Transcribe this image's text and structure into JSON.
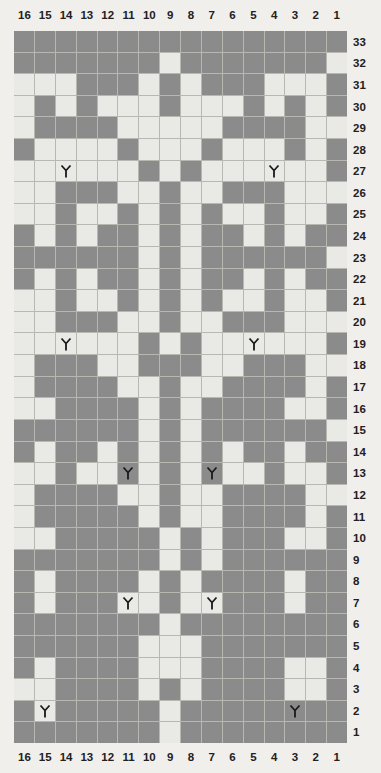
{
  "grid": {
    "columns": 16,
    "rows": 33,
    "column_labels": [
      "16",
      "15",
      "14",
      "13",
      "12",
      "11",
      "10",
      "9",
      "8",
      "7",
      "6",
      "5",
      "4",
      "3",
      "2",
      "1"
    ],
    "row_labels": [
      "33",
      "32",
      "31",
      "30",
      "29",
      "28",
      "27",
      "26",
      "25",
      "24",
      "23",
      "22",
      "21",
      "20",
      "19",
      "18",
      "17",
      "16",
      "15",
      "14",
      "13",
      "12",
      "11",
      "10",
      "9",
      "8",
      "7",
      "6",
      "5",
      "4",
      "3",
      "2",
      "1"
    ],
    "colors": {
      "background": "#f0efec",
      "light_cell": "#e9e9e5",
      "dark_cell": "#8b8b8b",
      "gridline": "#b9b7b2",
      "label_text": "#23201e",
      "symbol": "#1a1a1a"
    },
    "legend": {
      "light_cell_meaning": "knit / main color stitch",
      "dark_cell_meaning": "purl / contrast color stitch",
      "symbol_name": "decrease-symbol",
      "symbol_glyph": "Y"
    }
  },
  "chart_data": {
    "type": "heatmap",
    "xlabel": "",
    "ylabel": "",
    "x": [
      "16",
      "15",
      "14",
      "13",
      "12",
      "11",
      "10",
      "9",
      "8",
      "7",
      "6",
      "5",
      "4",
      "3",
      "2",
      "1"
    ],
    "y": [
      "33",
      "32",
      "31",
      "30",
      "29",
      "28",
      "27",
      "26",
      "25",
      "24",
      "23",
      "22",
      "21",
      "20",
      "19",
      "18",
      "17",
      "16",
      "15",
      "14",
      "13",
      "12",
      "11",
      "10",
      "9",
      "8",
      "7",
      "6",
      "5",
      "4",
      "3",
      "2",
      "1"
    ],
    "value_legend": {
      "0": "light",
      "1": "dark"
    },
    "rows": [
      {
        "row": "33",
        "cells": [
          1,
          1,
          1,
          1,
          1,
          1,
          1,
          1,
          1,
          1,
          1,
          1,
          1,
          1,
          1,
          1
        ]
      },
      {
        "row": "32",
        "cells": [
          1,
          1,
          1,
          1,
          1,
          1,
          1,
          0,
          1,
          1,
          1,
          1,
          1,
          1,
          1,
          0
        ]
      },
      {
        "row": "31",
        "cells": [
          0,
          0,
          0,
          1,
          1,
          1,
          0,
          1,
          0,
          1,
          1,
          1,
          0,
          0,
          0,
          1
        ]
      },
      {
        "row": "30",
        "cells": [
          0,
          1,
          0,
          1,
          0,
          0,
          0,
          1,
          0,
          0,
          0,
          1,
          0,
          1,
          0,
          1
        ]
      },
      {
        "row": "29",
        "cells": [
          0,
          1,
          1,
          1,
          1,
          0,
          0,
          0,
          0,
          0,
          1,
          1,
          1,
          1,
          0,
          0
        ]
      },
      {
        "row": "28",
        "cells": [
          1,
          0,
          0,
          0,
          0,
          1,
          0,
          0,
          0,
          1,
          0,
          0,
          0,
          1,
          0,
          1
        ]
      },
      {
        "row": "27",
        "cells": [
          0,
          0,
          0,
          0,
          0,
          0,
          1,
          0,
          1,
          0,
          0,
          0,
          0,
          0,
          0,
          1
        ]
      },
      {
        "row": "26",
        "cells": [
          0,
          0,
          1,
          1,
          1,
          0,
          0,
          1,
          0,
          0,
          1,
          1,
          1,
          0,
          0,
          0
        ]
      },
      {
        "row": "25",
        "cells": [
          0,
          0,
          1,
          0,
          0,
          1,
          0,
          1,
          0,
          1,
          0,
          0,
          1,
          0,
          0,
          1
        ]
      },
      {
        "row": "24",
        "cells": [
          1,
          0,
          1,
          0,
          1,
          1,
          0,
          1,
          0,
          1,
          1,
          0,
          1,
          0,
          1,
          1
        ]
      },
      {
        "row": "23",
        "cells": [
          1,
          1,
          1,
          1,
          1,
          1,
          0,
          1,
          0,
          1,
          1,
          1,
          1,
          1,
          1,
          0
        ]
      },
      {
        "row": "22",
        "cells": [
          1,
          0,
          1,
          0,
          1,
          1,
          0,
          1,
          0,
          1,
          1,
          0,
          1,
          0,
          1,
          1
        ]
      },
      {
        "row": "21",
        "cells": [
          0,
          0,
          1,
          0,
          0,
          1,
          0,
          1,
          0,
          1,
          0,
          0,
          1,
          0,
          0,
          1
        ]
      },
      {
        "row": "20",
        "cells": [
          0,
          0,
          1,
          1,
          1,
          0,
          0,
          1,
          0,
          0,
          1,
          1,
          1,
          0,
          0,
          0
        ]
      },
      {
        "row": "19",
        "cells": [
          0,
          0,
          0,
          0,
          0,
          0,
          1,
          0,
          1,
          0,
          0,
          0,
          0,
          0,
          0,
          1
        ]
      },
      {
        "row": "18",
        "cells": [
          0,
          1,
          1,
          1,
          0,
          0,
          1,
          1,
          1,
          0,
          0,
          1,
          1,
          1,
          0,
          0
        ]
      },
      {
        "row": "17",
        "cells": [
          0,
          1,
          1,
          1,
          1,
          0,
          0,
          1,
          0,
          0,
          1,
          1,
          1,
          1,
          0,
          1
        ]
      },
      {
        "row": "16",
        "cells": [
          0,
          0,
          1,
          1,
          1,
          1,
          0,
          1,
          0,
          1,
          1,
          1,
          1,
          0,
          0,
          1
        ]
      },
      {
        "row": "15",
        "cells": [
          1,
          1,
          1,
          1,
          1,
          1,
          0,
          1,
          0,
          1,
          1,
          1,
          1,
          1,
          1,
          0
        ]
      },
      {
        "row": "14",
        "cells": [
          1,
          0,
          1,
          1,
          0,
          1,
          0,
          1,
          0,
          1,
          0,
          1,
          1,
          0,
          1,
          1
        ]
      },
      {
        "row": "13",
        "cells": [
          0,
          0,
          1,
          0,
          0,
          1,
          0,
          1,
          0,
          1,
          0,
          0,
          1,
          0,
          0,
          1
        ]
      },
      {
        "row": "12",
        "cells": [
          0,
          1,
          1,
          1,
          1,
          0,
          0,
          1,
          0,
          0,
          1,
          1,
          1,
          1,
          0,
          0
        ]
      },
      {
        "row": "11",
        "cells": [
          0,
          1,
          1,
          1,
          1,
          1,
          0,
          1,
          0,
          0,
          1,
          1,
          1,
          1,
          0,
          1
        ]
      },
      {
        "row": "10",
        "cells": [
          0,
          0,
          1,
          1,
          1,
          1,
          1,
          0,
          1,
          0,
          1,
          1,
          1,
          0,
          0,
          1
        ]
      },
      {
        "row": "9",
        "cells": [
          1,
          1,
          1,
          1,
          1,
          1,
          1,
          0,
          1,
          0,
          1,
          1,
          1,
          1,
          1,
          1
        ]
      },
      {
        "row": "8",
        "cells": [
          1,
          0,
          1,
          1,
          1,
          1,
          0,
          1,
          0,
          1,
          1,
          1,
          1,
          0,
          1,
          1
        ]
      },
      {
        "row": "7",
        "cells": [
          1,
          0,
          1,
          1,
          1,
          0,
          0,
          1,
          0,
          0,
          1,
          1,
          1,
          0,
          1,
          1
        ]
      },
      {
        "row": "6",
        "cells": [
          1,
          1,
          1,
          1,
          1,
          1,
          1,
          0,
          1,
          1,
          1,
          1,
          1,
          1,
          1,
          1
        ]
      },
      {
        "row": "5",
        "cells": [
          1,
          1,
          1,
          1,
          1,
          1,
          0,
          0,
          0,
          1,
          1,
          1,
          1,
          1,
          1,
          1
        ]
      },
      {
        "row": "4",
        "cells": [
          1,
          0,
          1,
          1,
          1,
          1,
          0,
          0,
          0,
          1,
          1,
          1,
          1,
          0,
          0,
          1
        ]
      },
      {
        "row": "3",
        "cells": [
          0,
          0,
          1,
          1,
          1,
          1,
          0,
          1,
          0,
          1,
          1,
          1,
          1,
          0,
          0,
          1
        ]
      },
      {
        "row": "2",
        "cells": [
          1,
          0,
          1,
          1,
          1,
          1,
          1,
          0,
          1,
          1,
          1,
          1,
          1,
          1,
          1,
          1
        ]
      },
      {
        "row": "1",
        "cells": [
          1,
          1,
          1,
          1,
          1,
          1,
          1,
          0,
          1,
          1,
          1,
          1,
          1,
          1,
          1,
          1
        ]
      }
    ],
    "symbols": [
      {
        "row": "27",
        "column": "14"
      },
      {
        "row": "27",
        "column": "4"
      },
      {
        "row": "19",
        "column": "14"
      },
      {
        "row": "19",
        "column": "5"
      },
      {
        "row": "13",
        "column": "11"
      },
      {
        "row": "13",
        "column": "7"
      },
      {
        "row": "7",
        "column": "11"
      },
      {
        "row": "7",
        "column": "7"
      },
      {
        "row": "2",
        "column": "15"
      },
      {
        "row": "2",
        "column": "3"
      }
    ]
  }
}
